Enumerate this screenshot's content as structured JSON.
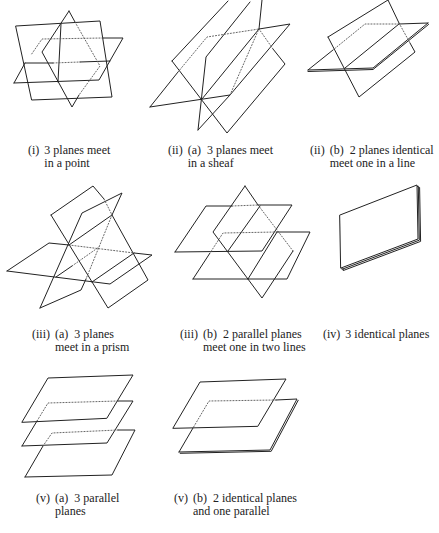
{
  "diagram": {
    "colors": {
      "line": "#222222",
      "background": "#ffffff"
    },
    "panels": [
      {
        "id": "i",
        "label": "(i)",
        "sub_label": "",
        "line1": "3 planes meet",
        "line2": "in a point"
      },
      {
        "id": "ii-a",
        "label": "(ii)",
        "sub_label": "(a)",
        "line1": "3 planes meet",
        "line2": "in a sheaf"
      },
      {
        "id": "ii-b",
        "label": "(ii)",
        "sub_label": "(b)",
        "line1": "2 planes identical",
        "line2": "meet one in a line"
      },
      {
        "id": "iii-a",
        "label": "(iii)",
        "sub_label": "(a)",
        "line1": "3 planes",
        "line2": "meet in a prism"
      },
      {
        "id": "iii-b",
        "label": "(iii)",
        "sub_label": "(b)",
        "line1": "2 parallel planes",
        "line2": "meet one in two lines"
      },
      {
        "id": "iv",
        "label": "(iv)",
        "sub_label": "",
        "line1": "3 identical planes",
        "line2": ""
      },
      {
        "id": "v-a",
        "label": "(v)",
        "sub_label": "(a)",
        "line1": "3 parallel",
        "line2": "planes"
      },
      {
        "id": "v-b",
        "label": "(v)",
        "sub_label": "(b)",
        "line1": "2 identical planes",
        "line2": "and one parallel"
      }
    ]
  }
}
